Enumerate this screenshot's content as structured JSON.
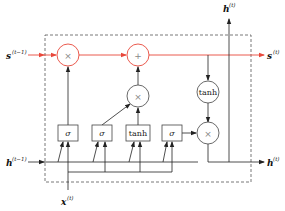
{
  "diagram": {
    "colors": {
      "cell_state": "#e8483b",
      "line": "#222222",
      "frame": "#555555"
    },
    "inputs": {
      "cell_state_prev": {
        "base": "s",
        "sup": "(t−1)"
      },
      "hidden_prev": {
        "base": "h",
        "sup": "(t−1)"
      },
      "input": {
        "base": "x",
        "sup": "(t)"
      }
    },
    "outputs": {
      "cell_state": {
        "base": "s",
        "sup": "(t)"
      },
      "hidden_top": {
        "base": "h",
        "sup": "(t)"
      },
      "hidden_right": {
        "base": "h",
        "sup": "(t)"
      }
    },
    "gates": [
      {
        "id": "forget",
        "label": "σ"
      },
      {
        "id": "input",
        "label": "σ"
      },
      {
        "id": "candidate",
        "label": "tanh"
      },
      {
        "id": "output",
        "label": "σ"
      }
    ],
    "ops": {
      "forget_mul": "×",
      "add": "+",
      "input_mul": "×",
      "cell_tanh": "tanh",
      "output_mul": "×"
    }
  }
}
